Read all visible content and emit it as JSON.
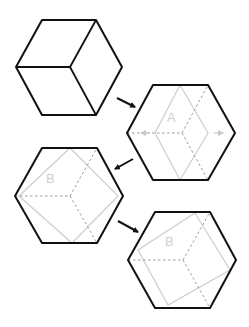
{
  "diagram": {
    "colors": {
      "outline": "#111111",
      "light": "#d0d0d0",
      "dashed": "#9a9a9a",
      "background": "#ffffff"
    },
    "panels": [
      {
        "id": "cube",
        "label": ""
      },
      {
        "id": "hex-a",
        "label": "A"
      },
      {
        "id": "hex-b1",
        "label": "B"
      },
      {
        "id": "hex-b2",
        "label": "B"
      }
    ],
    "arrows": [
      "cube-to-a",
      "a-to-b1",
      "b1-to-b2"
    ]
  }
}
